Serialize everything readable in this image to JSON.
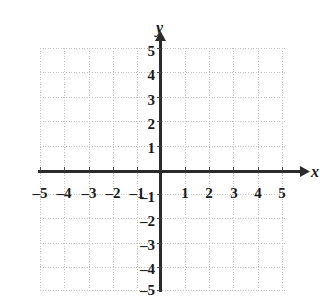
{
  "figure": {
    "kind": "cartesian-coordinate-grid",
    "background_color": "#ffffff",
    "axis_color": "#262626",
    "grid_color": "#c8c8c8",
    "label_color": "#1a1a1a"
  },
  "axes": {
    "x_axis_label": "x",
    "y_axis_label": "y",
    "x_arrow": "right-arrow-head",
    "y_arrow": "up-arrow-head"
  },
  "chart_data": {
    "type": "scatter",
    "title": "",
    "xlabel": "x",
    "ylabel": "y",
    "xlim": [
      -5,
      5
    ],
    "ylim": [
      -5,
      5
    ],
    "grid": true,
    "grid_style": "dotted",
    "grid_step": 1,
    "legend": null,
    "series": [],
    "x": [],
    "y": [],
    "x_ticks": [
      -5,
      -4,
      -3,
      -2,
      -1,
      1,
      2,
      3,
      4,
      5
    ],
    "y_ticks": [
      5,
      4,
      3,
      2,
      1,
      -1,
      -2,
      -3,
      -4,
      -5
    ],
    "x_tick_labels": [
      "–5",
      "–4",
      "–3",
      "–2",
      "–1",
      "1",
      "2",
      "3",
      "4",
      "5"
    ],
    "y_tick_labels": [
      "5",
      "4",
      "3",
      "2",
      "1",
      "–1",
      "–2",
      "–3",
      "–4",
      "–5"
    ],
    "annotations": []
  },
  "x_tick_items": [
    {
      "value": -5,
      "label": "–5",
      "px": 40,
      "py": 186
    },
    {
      "value": -4,
      "label": "–4",
      "px": 64,
      "py": 186
    },
    {
      "value": -3,
      "label": "–3",
      "px": 89,
      "py": 186
    },
    {
      "value": -2,
      "label": "–2",
      "px": 113,
      "py": 186
    },
    {
      "value": -1,
      "label": "–1",
      "px": 137,
      "py": 186
    },
    {
      "value": 1,
      "label": "1",
      "px": 185,
      "py": 186
    },
    {
      "value": 2,
      "label": "2",
      "px": 209,
      "py": 186
    },
    {
      "value": 3,
      "label": "3",
      "px": 234,
      "py": 186
    },
    {
      "value": 4,
      "label": "4",
      "px": 258,
      "py": 186
    },
    {
      "value": 5,
      "label": "5",
      "px": 282,
      "py": 186
    }
  ],
  "y_tick_items": [
    {
      "value": 5,
      "label": "5",
      "px": 155,
      "py": 51
    },
    {
      "value": 4,
      "label": "4",
      "px": 155,
      "py": 75
    },
    {
      "value": 3,
      "label": "3",
      "px": 155,
      "py": 100
    },
    {
      "value": 2,
      "label": "2",
      "px": 155,
      "py": 124
    },
    {
      "value": 1,
      "label": "1",
      "px": 155,
      "py": 148
    },
    {
      "value": -1,
      "label": "–1",
      "px": 155,
      "py": 197
    },
    {
      "value": -2,
      "label": "–2",
      "px": 155,
      "py": 221
    },
    {
      "value": -3,
      "label": "–3",
      "px": 155,
      "py": 245
    },
    {
      "value": -4,
      "label": "–4",
      "px": 155,
      "py": 269
    },
    {
      "value": -5,
      "label": "–5",
      "px": 155,
      "py": 290
    }
  ]
}
